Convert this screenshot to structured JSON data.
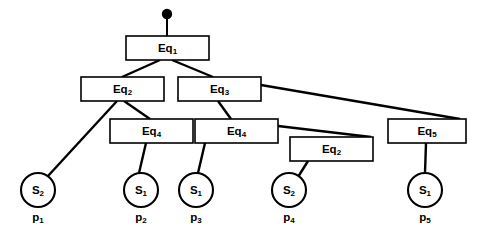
{
  "diagram": {
    "background_color": "#ffffff",
    "stroke_color": "#000000",
    "fill_color": "#ffffff",
    "root_marker": {
      "name": "root-dot",
      "cx": 167,
      "cy": 14,
      "r": 5.2,
      "stem_to_y": 36
    },
    "boxes": [
      {
        "id": "eq1",
        "base": "Eq",
        "sub": "1",
        "x": 126,
        "y": 36,
        "w": 83,
        "h": 24
      },
      {
        "id": "eq2-left",
        "base": "Eq",
        "sub": "2",
        "x": 81,
        "y": 77,
        "w": 83,
        "h": 24
      },
      {
        "id": "eq3",
        "base": "Eq",
        "sub": "3",
        "x": 178,
        "y": 77,
        "w": 83,
        "h": 24
      },
      {
        "id": "eq4-left",
        "base": "Eq",
        "sub": "4",
        "x": 110,
        "y": 119,
        "w": 83,
        "h": 24
      },
      {
        "id": "eq4-right",
        "base": "Eq",
        "sub": "4",
        "x": 195,
        "y": 119,
        "w": 83,
        "h": 24
      },
      {
        "id": "eq2-right",
        "base": "Eq",
        "sub": "2",
        "x": 290,
        "y": 137,
        "w": 83,
        "h": 24
      },
      {
        "id": "eq5",
        "base": "Eq",
        "sub": "5",
        "x": 388,
        "y": 119,
        "w": 78,
        "h": 24
      }
    ],
    "circles": [
      {
        "id": "s-p1",
        "base": "S",
        "sub": "2",
        "cx": 38,
        "cy": 190,
        "r": 17
      },
      {
        "id": "s-p2",
        "base": "S",
        "sub": "1",
        "cx": 141,
        "cy": 190,
        "r": 17
      },
      {
        "id": "s-p3",
        "base": "S",
        "sub": "1",
        "cx": 196,
        "cy": 190,
        "r": 17
      },
      {
        "id": "s-p4",
        "base": "S",
        "sub": "2",
        "cx": 289,
        "cy": 190,
        "r": 17
      },
      {
        "id": "s-p5",
        "base": "S",
        "sub": "1",
        "cx": 425,
        "cy": 190,
        "r": 17
      }
    ],
    "captions": [
      {
        "id": "cap-p1",
        "base": "p",
        "sub": "1",
        "x": 38,
        "y": 218
      },
      {
        "id": "cap-p2",
        "base": "p",
        "sub": "2",
        "x": 141,
        "y": 218
      },
      {
        "id": "cap-p3",
        "base": "p",
        "sub": "3",
        "x": 196,
        "y": 218
      },
      {
        "id": "cap-p4",
        "base": "p",
        "sub": "4",
        "x": 289,
        "y": 218
      },
      {
        "id": "cap-p5",
        "base": "p",
        "sub": "5",
        "x": 425,
        "y": 218
      }
    ],
    "edges": [
      {
        "id": "e-eq1-eq2",
        "from": "eq1",
        "to": "eq2-left",
        "x1": 160,
        "y1": 60,
        "x2": 122,
        "y2": 77
      },
      {
        "id": "e-eq1-eq3",
        "from": "eq1",
        "to": "eq3",
        "x1": 172,
        "y1": 60,
        "x2": 213,
        "y2": 77
      },
      {
        "id": "e-eq2-s1",
        "from": "eq2-left",
        "to": "s-p1",
        "x1": 117,
        "y1": 101,
        "x2": 48,
        "y2": 176
      },
      {
        "id": "e-eq2-eq4",
        "from": "eq2-left",
        "to": "eq4-left",
        "x1": 124,
        "y1": 101,
        "x2": 150,
        "y2": 119
      },
      {
        "id": "e-eq3-eq4r",
        "from": "eq3",
        "to": "eq4-right",
        "x1": 218,
        "y1": 101,
        "x2": 231,
        "y2": 119
      },
      {
        "id": "e-eq3-eq5",
        "from": "eq3",
        "to": "eq5",
        "x1": 261,
        "y1": 85,
        "x2": 460,
        "y2": 119
      },
      {
        "id": "e-eq4l-s2",
        "from": "eq4-left",
        "to": "s-p2",
        "x1": 146,
        "y1": 143,
        "x2": 139,
        "y2": 173
      },
      {
        "id": "e-eq4r-s3",
        "from": "eq4-right",
        "to": "s-p3",
        "x1": 205,
        "y1": 143,
        "x2": 198,
        "y2": 173
      },
      {
        "id": "e-eq4r-eq2r",
        "from": "eq4-right",
        "to": "eq2-right",
        "x1": 278,
        "y1": 126,
        "x2": 371,
        "y2": 137
      },
      {
        "id": "e-eq2r-s4",
        "from": "eq2-right",
        "to": "s-p4",
        "x1": 308,
        "y1": 161,
        "x2": 298,
        "y2": 177
      },
      {
        "id": "e-eq5-s5",
        "from": "eq5",
        "to": "s-p5",
        "x1": 426,
        "y1": 143,
        "x2": 425,
        "y2": 173
      }
    ]
  }
}
